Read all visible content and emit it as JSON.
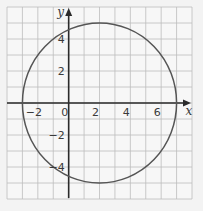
{
  "chart_data": {
    "type": "line",
    "title": "",
    "xlabel": "x",
    "ylabel": "y",
    "xlim": [
      -4,
      8
    ],
    "ylim": [
      -6,
      6
    ],
    "grid": true,
    "grid_step": 1,
    "x_ticks": [
      -2,
      0,
      2,
      4,
      6
    ],
    "y_ticks": [
      4,
      2,
      -2,
      -4
    ],
    "x_tick_labels": [
      "−2",
      "0",
      "2",
      "4",
      "6"
    ],
    "y_tick_labels": [
      "4",
      "2",
      "−2",
      "−4"
    ],
    "series": [
      {
        "name": "circle",
        "shape": "circle",
        "equation": "(x − 2)² + y² = 25",
        "center": [
          2,
          0
        ],
        "radius": 5,
        "points": [
          [
            -3,
            0
          ],
          [
            2,
            5
          ],
          [
            7,
            0
          ],
          [
            2,
            -5
          ],
          [
            0,
            4.58
          ],
          [
            0,
            -4.58
          ]
        ]
      }
    ],
    "legend": null
  },
  "colors": {
    "background": "#f3f3f3",
    "plot_background": "#f7f7f7",
    "grid": "#bdbdbd",
    "axes": "#2b2b2b",
    "curve": "#555555",
    "text": "#3a3a3a"
  }
}
